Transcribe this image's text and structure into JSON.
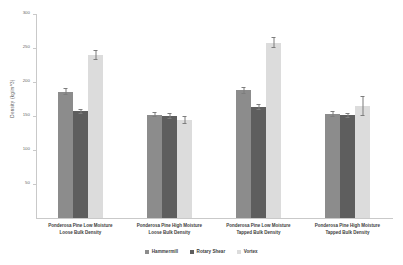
{
  "chart_data": {
    "type": "bar",
    "title": "",
    "xlabel": "",
    "ylabel": "Density (kg/m^3)",
    "ylim": [
      0,
      300
    ],
    "yticks": [
      300,
      250,
      200,
      150,
      100,
      50
    ],
    "ytick_labels": [
      "300",
      "250",
      "200",
      "150",
      "100",
      "50"
    ],
    "grid": false,
    "legend_position": "bottom-center",
    "categories": [
      "Ponderosa Pine Low Moisture Loose Bulk Density",
      "Ponderosa Pine High Moisture Loose Bulk Density",
      "Ponderosa Pine Low Moisture Tapped Bulk Density",
      "Ponderosa Pine High Moisture Tapped Bulk Density"
    ],
    "category_lines": [
      [
        "Ponderosa Pine Low Moisture",
        "Loose Bulk Density"
      ],
      [
        "Ponderosa Pine High Moisture",
        "Loose Bulk Density"
      ],
      [
        "Ponderosa Pine Low Moisture",
        "Tapped Bulk Density"
      ],
      [
        "Ponderosa Pine High Moisture",
        "Tapped Bulk Density"
      ]
    ],
    "series": [
      {
        "name": "Hammermill",
        "color": "#8c8c8c",
        "values": [
          186,
          152,
          188,
          153
        ],
        "errors": [
          5,
          4,
          5,
          4
        ]
      },
      {
        "name": "Rotary Shear",
        "color": "#5e5e5e",
        "values": [
          157,
          150,
          163,
          151
        ],
        "errors": [
          4,
          4,
          4,
          4
        ]
      },
      {
        "name": "Vortex",
        "color": "#dcdcdc",
        "values": [
          240,
          144,
          258,
          165
        ],
        "errors": [
          7,
          6,
          8,
          15
        ]
      }
    ]
  }
}
